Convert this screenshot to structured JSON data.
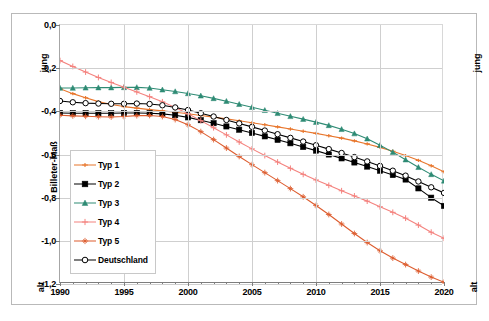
{
  "chart_data": {
    "type": "line",
    "title": "",
    "xlabel": "",
    "ylabel": "Billeter-Maß",
    "xlim": [
      1990,
      2020
    ],
    "ylim": [
      -1.2,
      0.0
    ],
    "grid": true,
    "legend_position": "inner-left",
    "x_ticks": [
      "1990",
      "1995",
      "2000",
      "2005",
      "2010",
      "2015",
      "2020"
    ],
    "x_tick_values": [
      1990,
      1995,
      2000,
      2005,
      2010,
      2015,
      2020
    ],
    "y_ticks": [
      "0,0",
      "-0,2",
      "-0,4",
      "-0,6",
      "-0,8",
      "-1,0",
      "-1,2"
    ],
    "y_tick_values": [
      0.0,
      -0.2,
      -0.4,
      -0.6,
      -0.8,
      -1.0,
      -1.2
    ],
    "annotations": {
      "left_top": "jung",
      "left_bottom": "alt",
      "right_top": "jung",
      "right_bottom": "alt"
    },
    "x": [
      1990,
      1991,
      1992,
      1993,
      1994,
      1995,
      1996,
      1997,
      1998,
      1999,
      2000,
      2001,
      2002,
      2003,
      2004,
      2005,
      2006,
      2007,
      2008,
      2009,
      2010,
      2011,
      2012,
      2013,
      2014,
      2015,
      2016,
      2017,
      2018,
      2019,
      2020
    ],
    "series": [
      {
        "name": "Typ 1",
        "color": "#E8762C",
        "marker": "plus",
        "values": [
          -0.295,
          -0.318,
          -0.337,
          -0.355,
          -0.368,
          -0.378,
          -0.385,
          -0.392,
          -0.398,
          -0.404,
          -0.411,
          -0.419,
          -0.427,
          -0.435,
          -0.444,
          -0.453,
          -0.462,
          -0.472,
          -0.482,
          -0.492,
          -0.502,
          -0.513,
          -0.524,
          -0.537,
          -0.551,
          -0.567,
          -0.585,
          -0.605,
          -0.627,
          -0.652,
          -0.68
        ]
      },
      {
        "name": "Typ 2",
        "color": "#000000",
        "marker": "square",
        "values": [
          -0.408,
          -0.409,
          -0.409,
          -0.409,
          -0.409,
          -0.408,
          -0.408,
          -0.409,
          -0.412,
          -0.418,
          -0.428,
          -0.441,
          -0.455,
          -0.47,
          -0.485,
          -0.5,
          -0.516,
          -0.532,
          -0.548,
          -0.565,
          -0.582,
          -0.6,
          -0.618,
          -0.637,
          -0.656,
          -0.675,
          -0.695,
          -0.716,
          -0.757,
          -0.8,
          -0.838
        ]
      },
      {
        "name": "Typ 3",
        "color": "#2E8B74",
        "marker": "triangle",
        "values": [
          -0.292,
          -0.292,
          -0.291,
          -0.29,
          -0.29,
          -0.289,
          -0.289,
          -0.292,
          -0.3,
          -0.308,
          -0.317,
          -0.328,
          -0.34,
          -0.353,
          -0.367,
          -0.381,
          -0.395,
          -0.409,
          -0.423,
          -0.436,
          -0.45,
          -0.465,
          -0.483,
          -0.503,
          -0.527,
          -0.557,
          -0.589,
          -0.624,
          -0.659,
          -0.692,
          -0.722
        ]
      },
      {
        "name": "Typ 4",
        "color": "#F4827E",
        "marker": "cross",
        "values": [
          -0.165,
          -0.192,
          -0.218,
          -0.243,
          -0.266,
          -0.288,
          -0.31,
          -0.332,
          -0.356,
          -0.382,
          -0.411,
          -0.443,
          -0.476,
          -0.509,
          -0.542,
          -0.574,
          -0.605,
          -0.635,
          -0.664,
          -0.692,
          -0.718,
          -0.743,
          -0.768,
          -0.792,
          -0.816,
          -0.842,
          -0.868,
          -0.895,
          -0.927,
          -0.96,
          -0.988
        ]
      },
      {
        "name": "Typ 5",
        "color": "#DD5C2E",
        "marker": "star",
        "values": [
          -0.418,
          -0.421,
          -0.423,
          -0.425,
          -0.426,
          -0.424,
          -0.42,
          -0.419,
          -0.424,
          -0.438,
          -0.462,
          -0.494,
          -0.531,
          -0.57,
          -0.609,
          -0.647,
          -0.684,
          -0.721,
          -0.758,
          -0.796,
          -0.836,
          -0.878,
          -0.922,
          -0.966,
          -1.008,
          -1.046,
          -1.08,
          -1.11,
          -1.14,
          -1.168,
          -1.192
        ]
      },
      {
        "name": "Deutschland",
        "color": "#000000",
        "marker": "circle-open",
        "values": [
          -0.352,
          -0.358,
          -0.362,
          -0.364,
          -0.365,
          -0.365,
          -0.364,
          -0.366,
          -0.372,
          -0.382,
          -0.394,
          -0.409,
          -0.424,
          -0.44,
          -0.456,
          -0.472,
          -0.489,
          -0.506,
          -0.523,
          -0.54,
          -0.557,
          -0.575,
          -0.593,
          -0.612,
          -0.632,
          -0.653,
          -0.675,
          -0.698,
          -0.725,
          -0.752,
          -0.778
        ]
      }
    ]
  }
}
